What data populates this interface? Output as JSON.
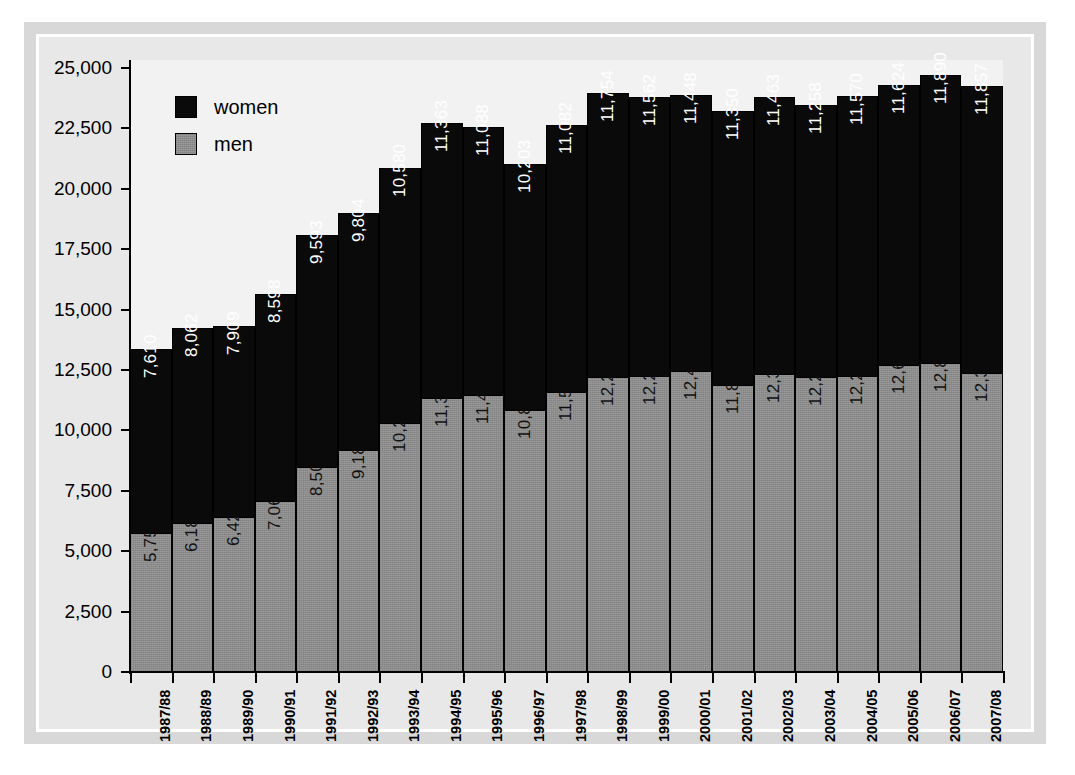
{
  "chart_data": {
    "type": "bar",
    "subtype": "stacked-column",
    "title": "",
    "xlabel": "",
    "ylabel": "",
    "ylim": [
      0,
      25000
    ],
    "ytick_values": [
      0,
      2500,
      5000,
      7500,
      10000,
      12500,
      15000,
      17500,
      20000,
      22500,
      25000
    ],
    "ytick_labels": [
      "0",
      "2,500",
      "5,000",
      "7,500",
      "10,000",
      "12,500",
      "15,000",
      "17,500",
      "20,000",
      "22,500",
      "25,000"
    ],
    "grid": false,
    "legend_position": "top-left",
    "categories": [
      "1987/88",
      "1988/89",
      "1989/90",
      "1990/91",
      "1991/92",
      "1992/93",
      "1993/94",
      "1994/95",
      "1995/96",
      "1996/97",
      "1997/98",
      "1998/99",
      "1999/00",
      "2000/01",
      "2001/02",
      "2002/03",
      "2003/04",
      "2004/05",
      "2005/06",
      "2006/07",
      "2007/08"
    ],
    "series": [
      {
        "name": "men",
        "color": "#8d8d8d",
        "stack_order": 0,
        "values": [
          5757,
          6181,
          6426,
          7069,
          8505,
          9182,
          10292,
          11358,
          11482,
          10842,
          11577,
          12226,
          12245,
          12442,
          11861,
          12349,
          12210,
          12264,
          12693,
          12809,
          12387
        ],
        "labels": [
          "5,757",
          "6,181",
          "6,426",
          "7,069",
          "8,505",
          "9,182",
          "10,292",
          "11,358",
          "11,482",
          "10,842",
          "11,577",
          "12,226",
          "12,245",
          "12,442",
          "11,861",
          "12,349",
          "12,210",
          "12,264",
          "12,693",
          "12,809",
          "12,387"
        ]
      },
      {
        "name": "women",
        "color": "#0a0a0a",
        "stack_order": 1,
        "values": [
          7610,
          8062,
          7909,
          8598,
          9593,
          9804,
          10580,
          11363,
          11088,
          10203,
          11082,
          11754,
          11562,
          11448,
          11350,
          11463,
          11258,
          11570,
          11624,
          11890,
          11857
        ],
        "labels": [
          "7,610",
          "8,062",
          "7,909",
          "8,598",
          "9,593",
          "9,804",
          "10,580",
          "11,363",
          "11,088",
          "10,203",
          "11,082",
          "11,754",
          "11,562",
          "11,448",
          "11,350",
          "11,463",
          "11,258",
          "11,570",
          "11,624",
          "11,890",
          "11,857"
        ]
      }
    ],
    "totals": [
      13367,
      14243,
      14335,
      15667,
      18098,
      18986,
      20872,
      22721,
      22570,
      21045,
      22659,
      23980,
      23807,
      23890,
      23211,
      23812,
      23468,
      23834,
      24317,
      24699,
      24244
    ]
  },
  "legend": {
    "entries": [
      {
        "label": "women",
        "color": "#0a0a0a"
      },
      {
        "label": "men",
        "color": "#8d8d8d"
      }
    ]
  },
  "colors": {
    "women": "#0a0a0a",
    "men": "#8d8d8d",
    "frame": "#d8d8d8",
    "frame_inner_border": "#ffffff",
    "plot_background": "#f2f2f2",
    "axis": "#000000"
  }
}
